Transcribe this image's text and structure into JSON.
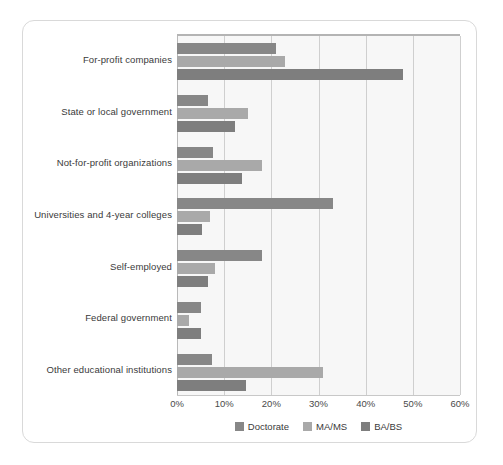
{
  "chart_data": {
    "type": "bar",
    "orientation": "horizontal",
    "title": "",
    "subtitle": "",
    "xlabel": "",
    "ylabel": "",
    "grid": true,
    "legend_position": "bottom",
    "xlim": [
      0,
      60
    ],
    "xticks": [
      0,
      10,
      20,
      30,
      40,
      50,
      60
    ],
    "xtick_labels": [
      "0%",
      "10%",
      "20%",
      "30%",
      "40%",
      "50%",
      "60%"
    ],
    "categories": [
      "For-profit companies",
      "State or local government",
      "Not-for-profit organizations",
      "Universities and 4-year colleges",
      "Self-employed",
      "Federal government",
      "Other educational institutions"
    ],
    "series": [
      {
        "name": "Doctorate",
        "color": "#878787",
        "values": [
          21,
          6.5,
          7.7,
          33,
          18,
          5,
          7.5
        ]
      },
      {
        "name": "MA/MS",
        "color": "#a9a9a9",
        "values": [
          23,
          15,
          18,
          7,
          8,
          2.5,
          31
        ]
      },
      {
        "name": "BA/BS",
        "color": "#7e7e7e",
        "values": [
          48,
          12.3,
          13.7,
          5.2,
          6.5,
          5,
          14.7
        ]
      }
    ]
  },
  "legend": {
    "items": [
      {
        "label": "Doctorate",
        "color": "#878787"
      },
      {
        "label": "MA/MS",
        "color": "#a9a9a9"
      },
      {
        "label": "BA/BS",
        "color": "#7e7e7e"
      }
    ]
  }
}
